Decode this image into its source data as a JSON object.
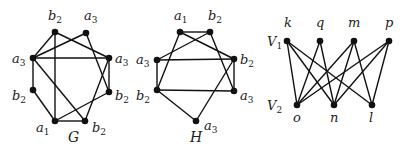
{
  "graphs": [
    {
      "id": "G",
      "name": "G",
      "name_pos": [
        68,
        142
      ],
      "nodes": [
        {
          "id": "g0",
          "base": "b",
          "sub": "2",
          "x": 55,
          "y": 32,
          "lx": 48,
          "ly": 20
        },
        {
          "id": "g1",
          "base": "a",
          "sub": "3",
          "x": 86,
          "y": 33,
          "lx": 84,
          "ly": 20
        },
        {
          "id": "g2",
          "base": "a",
          "sub": "3",
          "x": 33,
          "y": 58,
          "lx": 12,
          "ly": 63
        },
        {
          "id": "g3",
          "base": "a",
          "sub": "3",
          "x": 109,
          "y": 58,
          "lx": 115,
          "ly": 63
        },
        {
          "id": "g4",
          "base": "b",
          "sub": "2",
          "x": 33,
          "y": 90,
          "lx": 12,
          "ly": 100
        },
        {
          "id": "g5",
          "base": "b",
          "sub": "2",
          "x": 109,
          "y": 92,
          "lx": 115,
          "ly": 100
        },
        {
          "id": "g6",
          "base": "a",
          "sub": "1",
          "x": 55,
          "y": 121,
          "lx": 36,
          "ly": 132
        },
        {
          "id": "g7",
          "base": "b",
          "sub": "2",
          "x": 85,
          "y": 121,
          "lx": 92,
          "ly": 132
        }
      ],
      "edges": [
        [
          "g0",
          "g6"
        ],
        [
          "g0",
          "g2"
        ],
        [
          "g0",
          "g3"
        ],
        [
          "g1",
          "g2"
        ],
        [
          "g1",
          "g5"
        ],
        [
          "g2",
          "g3"
        ],
        [
          "g2",
          "g4"
        ],
        [
          "g2",
          "g7"
        ],
        [
          "g4",
          "g6"
        ],
        [
          "g6",
          "g7"
        ],
        [
          "g6",
          "g5"
        ],
        [
          "g3",
          "g5"
        ],
        [
          "g3",
          "g7"
        ]
      ]
    },
    {
      "id": "H",
      "name": "H",
      "name_pos": [
        190,
        142
      ],
      "nodes": [
        {
          "id": "h0",
          "base": "a",
          "sub": "1",
          "x": 180,
          "y": 32,
          "lx": 174,
          "ly": 20
        },
        {
          "id": "h1",
          "base": "b",
          "sub": "2",
          "x": 210,
          "y": 32,
          "lx": 208,
          "ly": 20
        },
        {
          "id": "h2",
          "base": "a",
          "sub": "3",
          "x": 157,
          "y": 60,
          "lx": 136,
          "ly": 64
        },
        {
          "id": "h3",
          "base": "b",
          "sub": "2",
          "x": 234,
          "y": 59,
          "lx": 240,
          "ly": 64
        },
        {
          "id": "h4",
          "base": "b",
          "sub": "2",
          "x": 157,
          "y": 90,
          "lx": 136,
          "ly": 100
        },
        {
          "id": "h5",
          "base": "a",
          "sub": "3",
          "x": 234,
          "y": 91,
          "lx": 240,
          "ly": 100
        },
        {
          "id": "h6",
          "base": "a",
          "sub": "3",
          "x": 196,
          "y": 121,
          "lx": 204,
          "ly": 130
        }
      ],
      "edges": [
        [
          "h0",
          "h1"
        ],
        [
          "h0",
          "h3"
        ],
        [
          "h0",
          "h4"
        ],
        [
          "h1",
          "h2"
        ],
        [
          "h1",
          "h5"
        ],
        [
          "h2",
          "h3"
        ],
        [
          "h2",
          "h4"
        ],
        [
          "h3",
          "h5"
        ],
        [
          "h3",
          "h6"
        ],
        [
          "h4",
          "h5"
        ],
        [
          "h4",
          "h6"
        ]
      ]
    },
    {
      "id": "B",
      "name": "",
      "side_labels": [
        {
          "base": "V",
          "sub": "1",
          "x": 267,
          "y": 46
        },
        {
          "base": "V",
          "sub": "2",
          "x": 267,
          "y": 110
        }
      ],
      "nodes": [
        {
          "id": "k",
          "base": "k",
          "sub": "",
          "x": 287,
          "y": 41,
          "lx": 284,
          "ly": 27
        },
        {
          "id": "q",
          "base": "q",
          "sub": "",
          "x": 320,
          "y": 41,
          "lx": 316,
          "ly": 27
        },
        {
          "id": "m",
          "base": "m",
          "sub": "",
          "x": 354,
          "y": 41,
          "lx": 348,
          "ly": 27
        },
        {
          "id": "p",
          "base": "p",
          "sub": "",
          "x": 389,
          "y": 41,
          "lx": 385,
          "ly": 27
        },
        {
          "id": "o",
          "base": "o",
          "sub": "",
          "x": 297,
          "y": 105,
          "lx": 293,
          "ly": 122
        },
        {
          "id": "n",
          "base": "n",
          "sub": "",
          "x": 334,
          "y": 105,
          "lx": 330,
          "ly": 122
        },
        {
          "id": "l",
          "base": "l",
          "sub": "",
          "x": 372,
          "y": 105,
          "lx": 369,
          "ly": 122
        }
      ],
      "edges": [
        [
          "k",
          "o"
        ],
        [
          "k",
          "n"
        ],
        [
          "k",
          "l"
        ],
        [
          "q",
          "o"
        ],
        [
          "q",
          "n"
        ],
        [
          "m",
          "o"
        ],
        [
          "m",
          "n"
        ],
        [
          "m",
          "l"
        ],
        [
          "p",
          "o"
        ],
        [
          "p",
          "n"
        ],
        [
          "p",
          "l"
        ]
      ]
    }
  ],
  "style": {
    "line_color": "#111111",
    "node_color": "#111111",
    "node_radius": 3.3
  }
}
